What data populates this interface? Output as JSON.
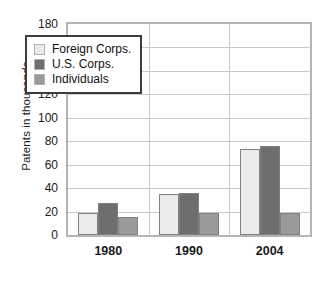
{
  "chart_data": {
    "type": "bar",
    "title": "",
    "subtitle": "",
    "xlabel": "",
    "ylabel": "Patents in thousands",
    "categories": [
      "1980",
      "1990",
      "2004"
    ],
    "series": [
      {
        "name": "Foreign Corps.",
        "values": [
          19,
          35,
          73
        ],
        "color": "#ebebeb"
      },
      {
        "name": "U.S. Corps.",
        "values": [
          27,
          36,
          76
        ],
        "color": "#6e6e6e"
      },
      {
        "name": "Individuals",
        "values": [
          15,
          19,
          19
        ],
        "color": "#9a9a9a"
      }
    ],
    "ylim": [
      0,
      180
    ],
    "yticks": [
      180,
      160,
      140,
      120,
      100,
      80,
      60,
      40,
      20,
      0
    ],
    "grid": "horizontal",
    "legend_position": "inside-upper-left",
    "bar_edge_color": "#808080",
    "grid_color": "#c9c9c9",
    "frame_color": "#b4b4b4",
    "legend_border_color": "#3d3d3d",
    "background": "#ffffff"
  }
}
